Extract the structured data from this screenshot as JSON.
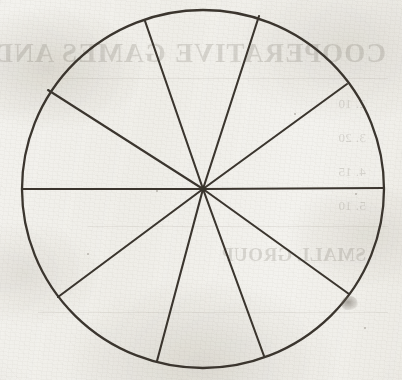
{
  "page": {
    "background_color": "#f3f2ee",
    "ink_color": "#3a352e",
    "width": 402,
    "height": 380
  },
  "figure": {
    "name": "fraction-circle",
    "shape": "circle",
    "sector_count": 10,
    "center": {
      "x": 203,
      "y": 189
    },
    "radius_x": 181,
    "radius_y": 179,
    "stroke_color": "#3a352e",
    "stroke_width": 2.1,
    "fill": "none",
    "spokes": [
      {
        "label": "spoke-east",
        "angle_deg": 0,
        "end_x": 384,
        "end_y": 188
      },
      {
        "label": "spoke-ene",
        "angle_deg": 35,
        "end_x": 347,
        "end_y": 84
      },
      {
        "label": "spoke-nne",
        "angle_deg": 72,
        "end_x": 259,
        "end_y": 16
      },
      {
        "label": "spoke-nnw",
        "angle_deg": 112,
        "end_x": 145,
        "end_y": 21
      },
      {
        "label": "spoke-wnw",
        "angle_deg": 149,
        "end_x": 48,
        "end_y": 90
      },
      {
        "label": "spoke-west",
        "angle_deg": 180,
        "end_x": 22,
        "end_y": 189
      },
      {
        "label": "spoke-wsw",
        "angle_deg": 217,
        "end_x": 58,
        "end_y": 297
      },
      {
        "label": "spoke-ssw",
        "angle_deg": 255,
        "end_x": 157,
        "end_y": 361
      },
      {
        "label": "spoke-sse",
        "angle_deg": 287,
        "end_x": 264,
        "end_y": 356
      },
      {
        "label": "spoke-ese",
        "angle_deg": 324,
        "end_x": 349,
        "end_y": 294
      }
    ]
  },
  "chart_data": {
    "type": "pie",
    "title": "",
    "categories": [
      "sector-1",
      "sector-2",
      "sector-3",
      "sector-4",
      "sector-5",
      "sector-6",
      "sector-7",
      "sector-8",
      "sector-9",
      "sector-10"
    ],
    "values": [
      35,
      37,
      40,
      37,
      31,
      37,
      38,
      32,
      37,
      36
    ],
    "value_unit": "degrees",
    "total": 360,
    "labels_shown": false,
    "legend": "none",
    "grid": false
  },
  "bleed_through": {
    "visible": true,
    "mirrored": true,
    "heading": "COOPERATIVE GAMES AND SPORTS",
    "lines": [
      "2. 10",
      "3. 20",
      "4. 15",
      "5. 10",
      "SMALL GROUP"
    ]
  },
  "artifacts": {
    "ink_smudge": {
      "x": 341,
      "y": 296,
      "width": 17,
      "height": 14
    },
    "specks": [
      {
        "x": 156,
        "y": 190,
        "size": 2
      },
      {
        "x": 355,
        "y": 193,
        "size": 2
      },
      {
        "x": 294,
        "y": 113,
        "size": 2
      },
      {
        "x": 87,
        "y": 253,
        "size": 2
      },
      {
        "x": 364,
        "y": 327,
        "size": 2
      }
    ]
  }
}
